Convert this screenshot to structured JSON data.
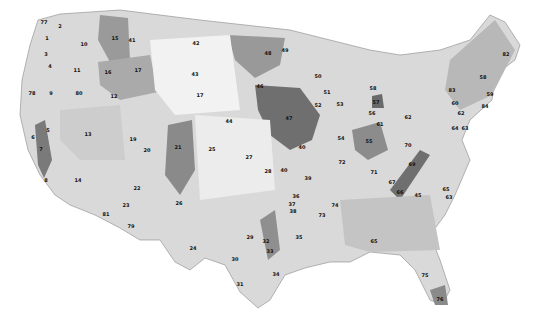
{
  "map": {
    "title": "United States Ecoregions (EPA Level III)",
    "colors": {
      "background": "#ffffff",
      "land_light": "#e6e6e6",
      "land_mid": "#c8c8c8",
      "land_dark": "#9a9a9a",
      "land_darkest": "#707070",
      "border": "#888888"
    },
    "labels": [
      {
        "id": "77",
        "x": 44,
        "y": 22
      },
      {
        "id": "2",
        "x": 60,
        "y": 26
      },
      {
        "id": "15",
        "x": 115,
        "y": 38
      },
      {
        "id": "41",
        "x": 132,
        "y": 40
      },
      {
        "id": "10",
        "x": 84,
        "y": 44
      },
      {
        "id": "1",
        "x": 47,
        "y": 38
      },
      {
        "id": "3",
        "x": 46,
        "y": 54
      },
      {
        "id": "4",
        "x": 50,
        "y": 66
      },
      {
        "id": "42",
        "x": 196,
        "y": 43
      },
      {
        "id": "48",
        "x": 268,
        "y": 53
      },
      {
        "id": "49",
        "x": 285,
        "y": 50
      },
      {
        "id": "11",
        "x": 77,
        "y": 70
      },
      {
        "id": "16",
        "x": 108,
        "y": 72
      },
      {
        "id": "17",
        "x": 138,
        "y": 70
      },
      {
        "id": "43",
        "x": 195,
        "y": 74
      },
      {
        "id": "46",
        "x": 260,
        "y": 86
      },
      {
        "id": "50",
        "x": 318,
        "y": 76
      },
      {
        "id": "51",
        "x": 327,
        "y": 92
      },
      {
        "id": "52",
        "x": 318,
        "y": 105
      },
      {
        "id": "53",
        "x": 340,
        "y": 104
      },
      {
        "id": "58",
        "x": 373,
        "y": 88
      },
      {
        "id": "57",
        "x": 376,
        "y": 102
      },
      {
        "id": "56",
        "x": 372,
        "y": 113
      },
      {
        "id": "78",
        "x": 32,
        "y": 93
      },
      {
        "id": "80",
        "x": 79,
        "y": 93
      },
      {
        "id": "9",
        "x": 51,
        "y": 93
      },
      {
        "id": "12",
        "x": 114,
        "y": 96
      },
      {
        "id": "17b",
        "x": 200,
        "y": 95
      },
      {
        "id": "47",
        "x": 289,
        "y": 118
      },
      {
        "id": "44",
        "x": 229,
        "y": 121
      },
      {
        "id": "54",
        "x": 341,
        "y": 138
      },
      {
        "id": "55",
        "x": 369,
        "y": 141
      },
      {
        "id": "61",
        "x": 380,
        "y": 124
      },
      {
        "id": "62",
        "x": 408,
        "y": 117
      },
      {
        "id": "5",
        "x": 48,
        "y": 130
      },
      {
        "id": "6",
        "x": 33,
        "y": 137
      },
      {
        "id": "7",
        "x": 41,
        "y": 149
      },
      {
        "id": "13",
        "x": 88,
        "y": 134
      },
      {
        "id": "19",
        "x": 133,
        "y": 139
      },
      {
        "id": "20",
        "x": 147,
        "y": 150
      },
      {
        "id": "21",
        "x": 178,
        "y": 147
      },
      {
        "id": "25",
        "x": 212,
        "y": 149
      },
      {
        "id": "27",
        "x": 249,
        "y": 157
      },
      {
        "id": "40",
        "x": 302,
        "y": 147
      },
      {
        "id": "72",
        "x": 342,
        "y": 162
      },
      {
        "id": "71",
        "x": 374,
        "y": 172
      },
      {
        "id": "70",
        "x": 408,
        "y": 145
      },
      {
        "id": "69",
        "x": 412,
        "y": 164
      },
      {
        "id": "64",
        "x": 455,
        "y": 128
      },
      {
        "id": "63",
        "x": 465,
        "y": 128
      },
      {
        "id": "8",
        "x": 46,
        "y": 180
      },
      {
        "id": "14",
        "x": 78,
        "y": 180
      },
      {
        "id": "22",
        "x": 137,
        "y": 188
      },
      {
        "id": "26",
        "x": 179,
        "y": 203
      },
      {
        "id": "28",
        "x": 268,
        "y": 171
      },
      {
        "id": "40b",
        "x": 284,
        "y": 170
      },
      {
        "id": "39",
        "x": 308,
        "y": 178
      },
      {
        "id": "67",
        "x": 392,
        "y": 182
      },
      {
        "id": "66",
        "x": 400,
        "y": 192
      },
      {
        "id": "45",
        "x": 418,
        "y": 195
      },
      {
        "id": "65",
        "x": 446,
        "y": 189
      },
      {
        "id": "63b",
        "x": 449,
        "y": 197
      },
      {
        "id": "23",
        "x": 126,
        "y": 205
      },
      {
        "id": "81",
        "x": 106,
        "y": 214
      },
      {
        "id": "79",
        "x": 131,
        "y": 226
      },
      {
        "id": "24",
        "x": 193,
        "y": 248
      },
      {
        "id": "29",
        "x": 250,
        "y": 237
      },
      {
        "id": "36",
        "x": 296,
        "y": 196
      },
      {
        "id": "37",
        "x": 292,
        "y": 204
      },
      {
        "id": "38",
        "x": 293,
        "y": 211
      },
      {
        "id": "73",
        "x": 322,
        "y": 215
      },
      {
        "id": "74",
        "x": 335,
        "y": 205
      },
      {
        "id": "35",
        "x": 299,
        "y": 237
      },
      {
        "id": "32",
        "x": 266,
        "y": 241
      },
      {
        "id": "33",
        "x": 270,
        "y": 251
      },
      {
        "id": "65b",
        "x": 374,
        "y": 241
      },
      {
        "id": "30",
        "x": 235,
        "y": 259
      },
      {
        "id": "34",
        "x": 276,
        "y": 274
      },
      {
        "id": "31",
        "x": 240,
        "y": 284
      },
      {
        "id": "75",
        "x": 425,
        "y": 275
      },
      {
        "id": "76",
        "x": 440,
        "y": 299
      },
      {
        "id": "82",
        "x": 506,
        "y": 54
      },
      {
        "id": "58b",
        "x": 483,
        "y": 77
      },
      {
        "id": "59",
        "x": 490,
        "y": 94
      },
      {
        "id": "84",
        "x": 485,
        "y": 106
      },
      {
        "id": "83",
        "x": 452,
        "y": 90
      },
      {
        "id": "60",
        "x": 455,
        "y": 103
      },
      {
        "id": "62b",
        "x": 461,
        "y": 113
      }
    ]
  }
}
